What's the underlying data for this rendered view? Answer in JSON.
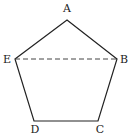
{
  "figure": {
    "stroke_color": "#222222",
    "background": "#ffffff",
    "vertices": [
      {
        "name": "A",
        "x": 67,
        "y": 20,
        "label_x": 67,
        "label_y": 12
      },
      {
        "name": "B",
        "x": 117,
        "y": 59,
        "label_x": 124,
        "label_y": 63
      },
      {
        "name": "C",
        "x": 98,
        "y": 121,
        "label_x": 100,
        "label_y": 133
      },
      {
        "name": "D",
        "x": 34,
        "y": 121,
        "label_x": 35,
        "label_y": 133
      },
      {
        "name": "E",
        "x": 15,
        "y": 59,
        "label_x": 7,
        "label_y": 63
      }
    ],
    "edges": [
      {
        "from": "A",
        "to": "B",
        "style": "solid"
      },
      {
        "from": "B",
        "to": "C",
        "style": "solid"
      },
      {
        "from": "C",
        "to": "D",
        "style": "solid"
      },
      {
        "from": "D",
        "to": "E",
        "style": "solid"
      },
      {
        "from": "E",
        "to": "A",
        "style": "solid"
      },
      {
        "from": "E",
        "to": "B",
        "style": "dashed"
      }
    ],
    "labels": {
      "A": "A",
      "B": "B",
      "C": "C",
      "D": "D",
      "E": "E"
    }
  }
}
